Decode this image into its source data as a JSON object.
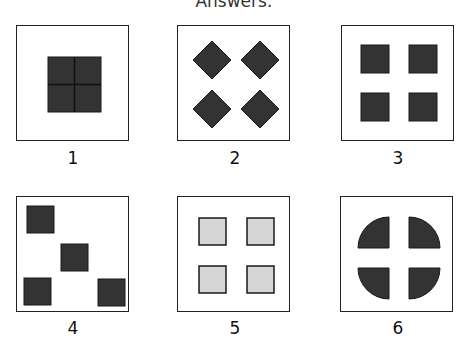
{
  "title": "Answers:",
  "colors": {
    "dark_fill": "#333333",
    "light_fill": "#d6d6d6",
    "stroke": "#1a1a1a",
    "frame": "#222222"
  },
  "options": [
    {
      "label": "1",
      "description": "one large square divided into four quadrants"
    },
    {
      "label": "2",
      "description": "four dark diamonds in a 2x2 grid"
    },
    {
      "label": "3",
      "description": "four dark squares in a 2x2 grid"
    },
    {
      "label": "4",
      "description": "four dark squares scattered"
    },
    {
      "label": "5",
      "description": "four light gray squares in a 2x2 grid"
    },
    {
      "label": "6",
      "description": "circle split into four quarter pieces by a cross gap"
    }
  ]
}
